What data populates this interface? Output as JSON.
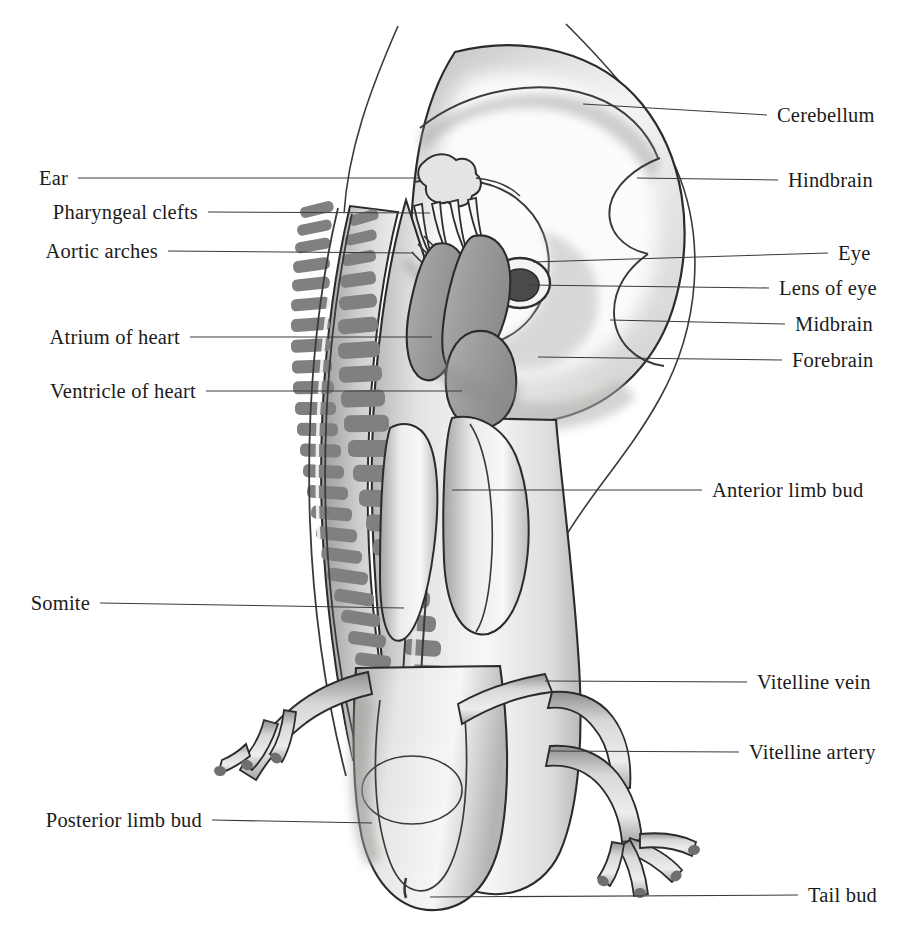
{
  "figure": {
    "kind": "anatomical-illustration",
    "width": 910,
    "height": 935,
    "background_color": "#ffffff"
  },
  "palette": {
    "outline": "#2b2b2b",
    "line_leader": "#3a3a3a",
    "label_text": "#1b1b1b",
    "tissue_light": "#f2f2f0",
    "tissue_mid": "#d3d3d1",
    "tissue_shadow": "#a8a8a6",
    "somite_gray": "#808080",
    "heart_gray": "#9a9a99",
    "lens_dark": "#4a4a4c",
    "vessel_gray": "#bdbdbb"
  },
  "labels_left": [
    {
      "id": "ear",
      "text": "Ear",
      "text_x": 68,
      "y": 178,
      "line_x1": 78,
      "line_x2": 418,
      "line_y2": 178
    },
    {
      "id": "pharyngeal-clefts",
      "text": "Pharyngeal clefts",
      "text_x": 198,
      "y": 212,
      "line_x1": 208,
      "line_x2": 430,
      "line_y2": 213
    },
    {
      "id": "aortic-arches",
      "text": "Aortic arches",
      "text_x": 158,
      "y": 251,
      "line_x1": 168,
      "line_x2": 412,
      "line_y2": 253
    },
    {
      "id": "atrium-of-heart",
      "text": "Atrium of heart",
      "text_x": 180,
      "y": 337,
      "line_x1": 190,
      "line_x2": 432,
      "line_y2": 337
    },
    {
      "id": "ventricle-of-heart",
      "text": "Ventricle of heart",
      "text_x": 196,
      "y": 391,
      "line_x1": 206,
      "line_x2": 462,
      "line_y2": 391
    },
    {
      "id": "somite",
      "text": "Somite",
      "text_x": 90,
      "y": 603,
      "line_x1": 100,
      "line_x2": 404,
      "line_y2": 608
    },
    {
      "id": "posterior-limb-bud",
      "text": "Posterior limb bud",
      "text_x": 202,
      "y": 820,
      "line_x1": 212,
      "line_x2": 372,
      "line_y2": 823
    }
  ],
  "labels_right": [
    {
      "id": "cerebellum",
      "text": "Cerebellum",
      "text_x": 777,
      "y": 115,
      "line_x1": 583,
      "line_y1": 104,
      "line_x2": 767,
      "line_y2": 115
    },
    {
      "id": "hindbrain",
      "text": "Hindbrain",
      "text_x": 788,
      "y": 180,
      "line_x1": 637,
      "line_y1": 178,
      "line_x2": 778,
      "line_y2": 180
    },
    {
      "id": "eye",
      "text": "Eye",
      "text_x": 838,
      "y": 253,
      "line_x1": 533,
      "line_y1": 262,
      "line_x2": 828,
      "line_y2": 253
    },
    {
      "id": "lens-of-eye",
      "text": "Lens of eye",
      "text_x": 779,
      "y": 288,
      "line_x1": 528,
      "line_y1": 285,
      "line_x2": 769,
      "line_y2": 288
    },
    {
      "id": "midbrain",
      "text": "Midbrain",
      "text_x": 795,
      "y": 324,
      "line_x1": 610,
      "line_y1": 320,
      "line_x2": 785,
      "line_y2": 324
    },
    {
      "id": "forebrain",
      "text": "Forebrain",
      "text_x": 792,
      "y": 360,
      "line_x1": 538,
      "line_y1": 357,
      "line_x2": 782,
      "line_y2": 360
    },
    {
      "id": "anterior-limb-bud",
      "text": "Anterior limb bud",
      "text_x": 712,
      "y": 490,
      "line_x1": 452,
      "line_y1": 490,
      "line_x2": 702,
      "line_y2": 490
    },
    {
      "id": "vitelline-vein",
      "text": "Vitelline vein",
      "text_x": 757,
      "y": 682,
      "line_x1": 545,
      "line_y1": 681,
      "line_x2": 747,
      "line_y2": 682
    },
    {
      "id": "vitelline-artery",
      "text": "Vitelline artery",
      "text_x": 749,
      "y": 752,
      "line_x1": 550,
      "line_y1": 751,
      "line_x2": 739,
      "line_y2": 752
    },
    {
      "id": "tail-bud",
      "text": "Tail bud",
      "text_x": 808,
      "y": 895,
      "line_x1": 430,
      "line_y1": 897,
      "line_x2": 798,
      "line_y2": 895
    }
  ],
  "structures": {
    "somite_count_outer": 26,
    "somite_count_inner": 24,
    "pharyngeal_cleft_count": 4,
    "aortic_arch_count": 4,
    "anterior_limb_digit_count": 3,
    "posterior_limb_digit_count": 4
  }
}
